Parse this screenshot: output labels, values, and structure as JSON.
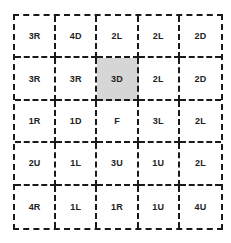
{
  "puzzle": {
    "highlight_color": "#d6d6d6",
    "rows": [
      [
        "3R",
        "4D",
        "2L",
        "2L",
        "2D"
      ],
      [
        "3R",
        "3R",
        "3D",
        "2L",
        "2D"
      ],
      [
        "1R",
        "1D",
        "F",
        "3L",
        "2L"
      ],
      [
        "2U",
        "1L",
        "3U",
        "1U",
        "2L"
      ],
      [
        "4R",
        "1L",
        "1R",
        "1U",
        "4U"
      ]
    ],
    "highlighted_cell": {
      "row": 1,
      "col": 2,
      "label": "3D"
    }
  }
}
